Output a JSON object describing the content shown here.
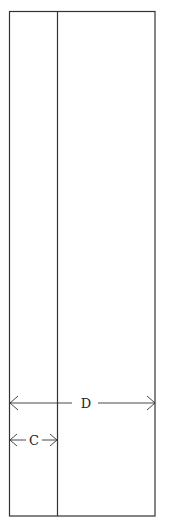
{
  "diagram": {
    "colors": {
      "stroke": "#333333",
      "background": "#ffffff"
    },
    "outer_rect": {
      "x": 9,
      "y": 11,
      "width": 146,
      "height": 505
    },
    "divider_x": 57,
    "dimensions": [
      {
        "label": "D",
        "y": 403,
        "x1": 10,
        "x2": 155
      },
      {
        "label": "C",
        "y": 440,
        "x1": 10,
        "x2": 57
      }
    ]
  }
}
